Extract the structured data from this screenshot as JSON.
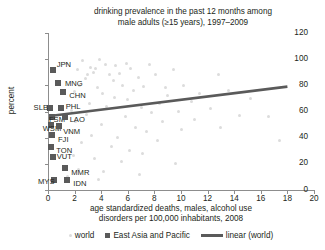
{
  "chart_data": {
    "type": "scatter",
    "title": "drinking prevalence in the past 12 months among male adults (≥15 years), 1997–2009",
    "title_line1": "drinking prevalence in the past 12 months among",
    "title_line2": "male adults (≥15 years), 1997–2009",
    "xlabel": "age standardized deaths, males, alcohol use disorders per 100,000 inhabitants, 2008",
    "xlabel_line1": "age standardized deaths, males, alcohol use",
    "xlabel_line2": "disorders per 100,000 inhabitants, 2008",
    "ylabel": "percent",
    "xlim": [
      0,
      20
    ],
    "ylim": [
      0,
      120
    ],
    "xticks": [
      0,
      2,
      4,
      6,
      8,
      10,
      12,
      14,
      16,
      18,
      20
    ],
    "yticks": [
      0,
      20,
      40,
      60,
      80,
      100,
      120
    ],
    "grid": false,
    "legend_position": "bottom",
    "colors": {
      "world": "#dcdcdc",
      "east_asia_pacific": "#5a5a5a",
      "trend": "#5a5a5a",
      "axis": "#8d8d8d",
      "text": "#231f20"
    },
    "series": [
      {
        "name": "world",
        "marker": "circle",
        "color": "#dcdcdc",
        "points": [
          [
            3.2,
            94
          ],
          [
            3.6,
            93
          ],
          [
            4.3,
            96
          ],
          [
            5.1,
            95
          ],
          [
            5.9,
            97
          ],
          [
            6.2,
            93
          ],
          [
            7.6,
            96
          ],
          [
            3.0,
            88
          ],
          [
            3.4,
            90
          ],
          [
            4.6,
            88
          ],
          [
            5.4,
            89
          ],
          [
            2.8,
            85
          ],
          [
            6.8,
            86
          ],
          [
            9.4,
            92
          ],
          [
            2.6,
            99
          ],
          [
            3.9,
            100
          ],
          [
            1.4,
            97
          ],
          [
            2.2,
            92
          ],
          [
            4.9,
            84
          ],
          [
            8.1,
            88
          ],
          [
            2.4,
            80
          ],
          [
            3.7,
            78
          ],
          [
            5.6,
            80
          ],
          [
            6.4,
            76
          ],
          [
            7.2,
            79
          ],
          [
            4.1,
            74
          ],
          [
            8.8,
            78
          ],
          [
            10.2,
            80
          ],
          [
            2.0,
            75
          ],
          [
            5.0,
            71
          ],
          [
            6.0,
            69
          ],
          [
            9.0,
            72
          ],
          [
            11.4,
            74
          ],
          [
            12.8,
            88
          ],
          [
            13.6,
            76
          ],
          [
            3.1,
            66
          ],
          [
            4.4,
            64
          ],
          [
            7.0,
            63
          ],
          [
            8.4,
            66
          ],
          [
            10.8,
            68
          ],
          [
            15.2,
            70
          ],
          [
            1.8,
            61
          ],
          [
            2.9,
            58
          ],
          [
            5.8,
            56
          ],
          [
            7.8,
            59
          ],
          [
            9.8,
            60
          ],
          [
            12.2,
            62
          ],
          [
            14.4,
            57
          ],
          [
            2.1,
            52
          ],
          [
            4.0,
            50
          ],
          [
            6.6,
            48
          ],
          [
            8.6,
            52
          ],
          [
            11.0,
            54
          ],
          [
            16.6,
            56
          ],
          [
            1.6,
            44
          ],
          [
            3.3,
            42
          ],
          [
            5.2,
            40
          ],
          [
            7.4,
            45
          ],
          [
            10.0,
            46
          ],
          [
            13.0,
            48
          ],
          [
            2.5,
            36
          ],
          [
            4.8,
            33
          ],
          [
            6.1,
            30
          ],
          [
            8.2,
            38
          ],
          [
            17.4,
            38
          ],
          [
            1.9,
            26
          ],
          [
            3.5,
            24
          ],
          [
            5.5,
            22
          ],
          [
            7.1,
            28
          ],
          [
            9.6,
            20
          ],
          [
            2.3,
            16
          ],
          [
            4.2,
            14
          ],
          [
            6.9,
            12
          ],
          [
            1.5,
            10
          ],
          [
            3.8,
            8
          ]
        ]
      },
      {
        "name": "East Asia and Pacific",
        "marker": "square",
        "color": "#5a5a5a",
        "points": [
          {
            "code": "JPN",
            "x": 0.35,
            "y": 92,
            "label_dx": 4,
            "label_dy": -9
          },
          {
            "code": "MNG",
            "x": 0.75,
            "y": 82,
            "label_dx": 7,
            "label_dy": -3
          },
          {
            "code": "CHN",
            "x": 1.15,
            "y": 75,
            "label_dx": 6,
            "label_dy": 0
          },
          {
            "code": "SLB",
            "x": 0.12,
            "y": 63,
            "label_dx": -16,
            "label_dy": -4
          },
          {
            "code": "PHL",
            "x": 0.95,
            "y": 63,
            "label_dx": 5,
            "label_dy": -5
          },
          {
            "code": "FSM",
            "x": 0.3,
            "y": 56,
            "label_dx": -3,
            "label_dy": -1
          },
          {
            "code": "LAO",
            "x": 1.25,
            "y": 56,
            "label_dx": 5,
            "label_dy": -1
          },
          {
            "code": "WSM",
            "x": 0.2,
            "y": 50,
            "label_dx": -8,
            "label_dy": 0
          },
          {
            "code": "VNM",
            "x": 0.85,
            "y": 49,
            "label_dx": 4,
            "label_dy": 2
          },
          {
            "code": "FJI",
            "x": 0.3,
            "y": 42,
            "label_dx": 6,
            "label_dy": 1
          },
          {
            "code": "TON",
            "x": 0.25,
            "y": 33,
            "label_dx": 5,
            "label_dy": 0
          },
          {
            "code": "VUT",
            "x": 0.35,
            "y": 25,
            "label_dx": 4,
            "label_dy": -4
          },
          {
            "code": "MMR",
            "x": 1.3,
            "y": 17,
            "label_dx": 6,
            "label_dy": 1
          },
          {
            "code": "MYS",
            "x": 0.45,
            "y": 8,
            "label_dx": -16,
            "label_dy": -2
          },
          {
            "code": "IDN",
            "x": 1.45,
            "y": 8,
            "label_dx": 6,
            "label_dy": 0
          }
        ]
      }
    ],
    "trendline": {
      "name": "linear (world)",
      "color": "#5a5a5a",
      "x0": 0.45,
      "y0": 57,
      "x1": 18.0,
      "y1": 79
    },
    "legend": [
      {
        "label": "world",
        "marker": "circle",
        "color": "#dcdcdc"
      },
      {
        "label": "East Asia and Pacific",
        "marker": "square",
        "color": "#5a5a5a"
      },
      {
        "label": "linear (world)",
        "marker": "line",
        "color": "#5a5a5a"
      }
    ]
  }
}
